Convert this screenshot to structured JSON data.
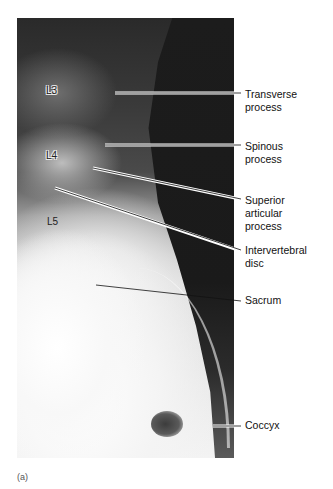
{
  "figure": {
    "panel_label": "(a)",
    "vertebra_labels": [
      {
        "text": "L3",
        "x": 46,
        "y": 85,
        "style": "outlined"
      },
      {
        "text": "L4",
        "x": 46,
        "y": 150,
        "style": "outlined"
      },
      {
        "text": "L5",
        "x": 47,
        "y": 216,
        "style": "plain"
      }
    ],
    "callouts": [
      {
        "lines": [
          "Transverse",
          "process"
        ],
        "top": 89,
        "leader": {
          "x1": 115,
          "y1": 93,
          "x2": 241,
          "y2": 93
        }
      },
      {
        "lines": [
          "Spinous",
          "process"
        ],
        "top": 141,
        "leader": {
          "x1": 105,
          "y1": 145,
          "x2": 241,
          "y2": 145
        }
      },
      {
        "lines": [
          "Superior",
          "articular",
          "process"
        ],
        "top": 195,
        "leader": {
          "x1": 93,
          "y1": 168,
          "x2": 241,
          "y2": 199
        }
      },
      {
        "lines": [
          "Intervertebral",
          "disc"
        ],
        "top": 245,
        "leader": {
          "x1": 55,
          "y1": 188,
          "x2": 241,
          "y2": 250
        }
      },
      {
        "lines": [
          "Sacrum"
        ],
        "top": 293,
        "leader": {
          "x1": 96,
          "y1": 285,
          "x2": 241,
          "y2": 301
        }
      },
      {
        "lines": [
          "Coccyx"
        ],
        "top": 419,
        "leader": {
          "x1": 213,
          "y1": 426,
          "x2": 241,
          "y2": 426
        }
      }
    ]
  }
}
